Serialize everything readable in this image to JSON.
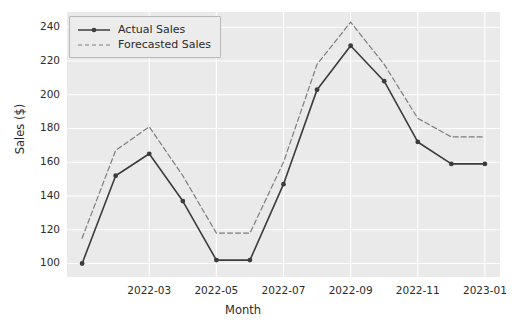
{
  "chart_data": {
    "type": "line",
    "title": "",
    "xlabel": "Month",
    "ylabel": "Sales ($)",
    "x": [
      "2022-01",
      "2022-02",
      "2022-03",
      "2022-04",
      "2022-05",
      "2022-06",
      "2022-07",
      "2022-08",
      "2022-09",
      "2022-10",
      "2022-11",
      "2022-12",
      "2023-01"
    ],
    "xtick_labels": [
      "2022-03",
      "2022-05",
      "2022-07",
      "2022-09",
      "2022-11",
      "2023-01"
    ],
    "ytick_labels": [
      "100",
      "120",
      "140",
      "160",
      "180",
      "200",
      "220",
      "240"
    ],
    "ylim": [
      92,
      249
    ],
    "xlim_index": [
      -0.45,
      12.45
    ],
    "grid": true,
    "legend_position": "upper left",
    "series": [
      {
        "name": "Actual Sales",
        "style": "solid",
        "marker": "circle",
        "color": "#3c3c3c",
        "values": [
          100,
          152,
          165,
          137,
          102,
          102,
          147,
          203,
          229,
          208,
          172,
          159,
          159
        ]
      },
      {
        "name": "Forecasted Sales",
        "style": "dashed",
        "marker": "none",
        "color": "#7d7d7d",
        "values": [
          115,
          167,
          181,
          152,
          118,
          118,
          160,
          218,
          243,
          218,
          186,
          175,
          175
        ]
      }
    ]
  },
  "legend": {
    "entries": [
      {
        "label": "Actual Sales"
      },
      {
        "label": "Forecasted Sales"
      }
    ]
  },
  "style": {
    "plot_background": "#eaeaea",
    "figure_background": "#ffffff",
    "gridline_color": "#ffffff",
    "text_color": "#2b2b2b"
  }
}
